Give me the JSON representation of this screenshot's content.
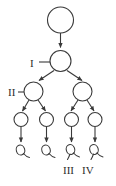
{
  "diagram": {
    "background_color": "#ffffff",
    "stroke_color": "#3a3a3a",
    "levels": [
      {
        "level_index": 0,
        "label": "",
        "node_kind": "large-circle",
        "node_count": 1
      },
      {
        "level_index": 1,
        "label": "I",
        "node_kind": "medium-circle",
        "node_count": 1
      },
      {
        "level_index": 2,
        "label": "II",
        "node_kind": "medium-circle",
        "node_count": 2
      },
      {
        "level_index": 3,
        "label": "",
        "node_kind": "small-circle",
        "node_count": 4
      },
      {
        "level_index": 4,
        "label": "",
        "node_kind": "leaf-glyph",
        "node_count": 4
      }
    ],
    "labels": {
      "level_one": "I",
      "level_two": "II",
      "leaf_three": "III",
      "leaf_four": "IV"
    },
    "edges": {
      "root_to_one": 1,
      "one_to_two": 2,
      "two_to_three": 4,
      "three_to_leaf": 4,
      "arrowheads": "filled-triangle"
    }
  }
}
